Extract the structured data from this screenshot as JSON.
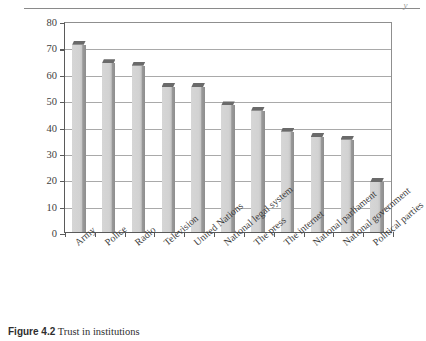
{
  "header": {
    "rule_mark": "y"
  },
  "caption": {
    "label": "Figure 4.2",
    "text": "Trust in institutions"
  },
  "chart_data": {
    "type": "bar",
    "title": "Trust in institutions",
    "xlabel": "",
    "ylabel": "Percentage tending to trust",
    "ylim": [
      0,
      80
    ],
    "ytick_step": 10,
    "yticks": [
      0,
      10,
      20,
      30,
      40,
      50,
      60,
      70,
      80
    ],
    "ytick_labels": [
      "0",
      "10",
      "20",
      "30",
      "40",
      "50",
      "60",
      "70",
      "80"
    ],
    "grid": true,
    "legend": "none",
    "bar_style": "3d-shaded-grey",
    "categories": [
      "Army",
      "Police",
      "Radio",
      "Television",
      "United Nations",
      "National legal system",
      "The press",
      "The internet",
      "National parliament",
      "National government",
      "Political parties"
    ],
    "values": [
      71,
      64,
      63,
      55,
      55,
      48,
      46,
      38,
      36,
      35,
      19
    ]
  },
  "colors": {
    "bar_fill": "#cecece",
    "bar_shadow": "#8e8e8e",
    "bar_top": "#6a6a6a",
    "axis": "#5a5a5a",
    "gridline": "#a9a9a9",
    "text": "#3a3a3a",
    "page_rule": "#8a8a8a"
  }
}
